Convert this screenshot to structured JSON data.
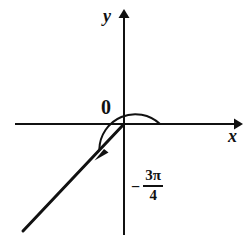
{
  "figure": {
    "background_color": "#ffffff",
    "stroke_color": "#111111",
    "width": 252,
    "height": 245
  },
  "axes": {
    "x_label": "x",
    "y_label": "y",
    "origin_label": "0",
    "origin": {
      "x": 124,
      "y": 124
    },
    "x_axis": {
      "start_x": 15,
      "end_x": 240,
      "y": 124,
      "arrow": "right"
    },
    "y_axis": {
      "x": 124,
      "start_y": 235,
      "end_y": 12,
      "arrow": "up"
    }
  },
  "angle": {
    "minus_sign": "−",
    "numerator": "3π",
    "denominator": "4",
    "value_text": "−3π/4",
    "measure_degrees": -135,
    "direction": "clockwise",
    "arc_radius": 36,
    "arc_start_angle_degrees": 0,
    "arc_end_angle_degrees": -135
  },
  "terminal_ray": {
    "from": {
      "x": 124,
      "y": 124
    },
    "to": {
      "x": 22,
      "y": 232
    },
    "angle_degrees": -135,
    "quadrant": 3
  }
}
